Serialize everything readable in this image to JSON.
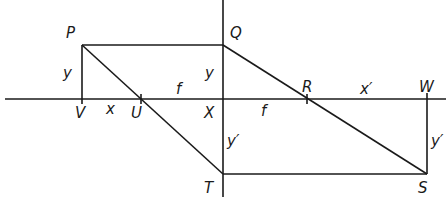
{
  "diagram": {
    "type": "ray-diagram-thin-lens",
    "points": {
      "P": "P",
      "Q": "Q",
      "R": "R",
      "W": "W",
      "V": "V",
      "U": "U",
      "X": "X",
      "T": "T",
      "S": "S"
    },
    "segment_labels": {
      "PV": "y",
      "QX": "y",
      "VU": "x",
      "UX": "f",
      "XR": "f",
      "RW": "x′",
      "XT": "y′",
      "WS": "y′"
    },
    "color": "#1a1a1a"
  }
}
